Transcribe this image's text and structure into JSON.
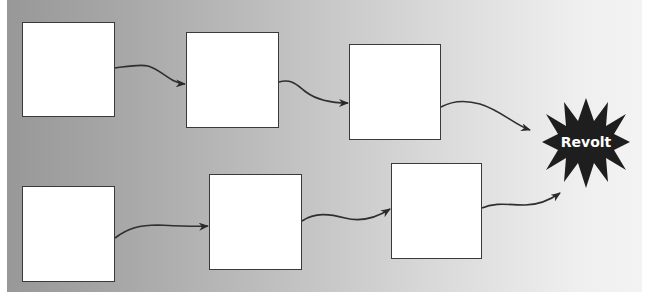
{
  "diagram": {
    "type": "flow",
    "background": {
      "from": "#989898",
      "to": "#f3f3f3"
    },
    "rows": [
      {
        "name": "top-row",
        "boxes": [
          {
            "id": "box-1",
            "x": 22,
            "y": 22,
            "w": 93,
            "h": 95,
            "label": ""
          },
          {
            "id": "box-2",
            "x": 186,
            "y": 32,
            "w": 93,
            "h": 96,
            "label": ""
          },
          {
            "id": "box-3",
            "x": 349,
            "y": 44,
            "w": 92,
            "h": 96,
            "label": ""
          }
        ]
      },
      {
        "name": "bottom-row",
        "boxes": [
          {
            "id": "box-4",
            "x": 22,
            "y": 186,
            "w": 93,
            "h": 96,
            "label": ""
          },
          {
            "id": "box-5",
            "x": 209,
            "y": 174,
            "w": 93,
            "h": 96,
            "label": ""
          },
          {
            "id": "box-6",
            "x": 391,
            "y": 163,
            "w": 91,
            "h": 96,
            "label": ""
          }
        ]
      }
    ],
    "arrows": [
      {
        "from": "box-1",
        "to": "box-2"
      },
      {
        "from": "box-2",
        "to": "box-3"
      },
      {
        "from": "box-3",
        "to": "revolt"
      },
      {
        "from": "box-4",
        "to": "box-5"
      },
      {
        "from": "box-5",
        "to": "box-6"
      },
      {
        "from": "box-6",
        "to": "revolt"
      }
    ],
    "target": {
      "id": "revolt",
      "shape": "starburst",
      "label": "Revolt",
      "fill": "#1e1e1e",
      "text_color": "#ffffff"
    }
  }
}
